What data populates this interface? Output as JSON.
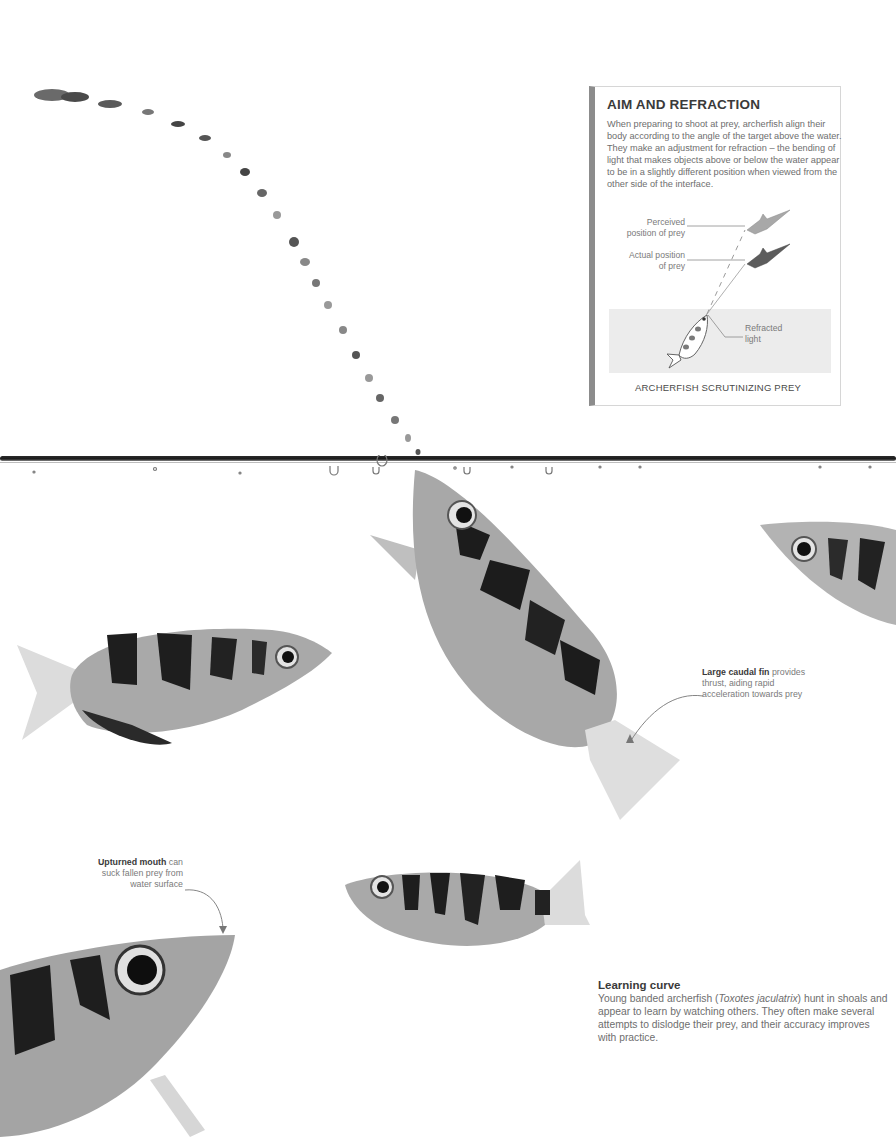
{
  "page": {
    "background": "#ffffff",
    "accent_bar_color": "#8c8c8c"
  },
  "infobox": {
    "title": "AIM AND REFRACTION",
    "body": "When preparing to shoot at prey, archerfish align their body according to the angle of the target above the water. They make an adjustment for refraction – the bending of light that makes objects above or below the water appear to be in a slightly different position when viewed from the other side of the interface.",
    "diagram": {
      "labels": {
        "perceived_line1": "Perceived",
        "perceived_line2": "position of prey",
        "actual_line1": "Actual position",
        "actual_line2": "of prey",
        "refracted_line1": "Refracted",
        "refracted_line2": "light"
      },
      "caption": "ARCHERFISH SCRUTINIZING PREY",
      "water_color": "#ececec"
    }
  },
  "annotations": {
    "caudal_fin": {
      "bold": "Large caudal fin",
      "text_line1": " provides",
      "text_line2": "thrust, aiding rapid",
      "text_line3": "acceleration towards prey"
    },
    "mouth": {
      "bold": "Upturned mouth",
      "text_line1": " can",
      "text_line2": "suck fallen prey from",
      "text_line3": "water surface"
    }
  },
  "learning_curve": {
    "title": "Learning curve",
    "body_before_italic": "Young banded archerfish (",
    "species_italic": "Toxotes jaculatrix",
    "body_after_italic": ") hunt in shoals and appear to learn by watching others. They often make several attempts to dislodge their prey, and their accuracy improves with practice."
  },
  "photo_elements": {
    "water_jet": "arc of water droplets",
    "water_surface": "water line with bubbles",
    "fish": [
      "fish-left-side",
      "fish-center-upturned",
      "fish-right-partial",
      "fish-small-center",
      "fish-bottom-left-closeup"
    ]
  }
}
